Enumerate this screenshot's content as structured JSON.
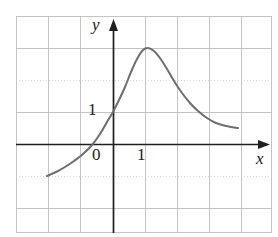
{
  "figure": {
    "name": "graph-on-grid-paper",
    "background_color": "#ffffff",
    "grid": {
      "visible": true,
      "line_color": "#b9b9b9",
      "dotted_line_color": "#c9c9c9",
      "cell_size_px": 32,
      "left_px": 16,
      "top_px": 16,
      "right_px": 272,
      "bottom_px": 233,
      "columns": 8,
      "rows": 7
    },
    "axes": {
      "color": "#1f1f1f",
      "origin_px": {
        "x": 113,
        "y": 144
      },
      "x_axis": {
        "label": "x",
        "arrow": true,
        "start_px": 16,
        "end_px": 270,
        "y_px": 144
      },
      "y_axis": {
        "label": "y",
        "arrow": true,
        "start_px": 233,
        "end_px": 19,
        "x_px": 113
      }
    },
    "tick_labels": {
      "y_one": "1",
      "x_zero": "0",
      "x_one": "1"
    }
  },
  "chart_data": {
    "type": "line",
    "title": "",
    "xlabel": "x",
    "ylabel": "y",
    "grid": true,
    "legend": null,
    "xlim": [
      -3.03,
      4.97
    ],
    "ylim": [
      -3.5,
      4.0
    ],
    "x_unit_px": 32,
    "y_unit_px": 32,
    "x_tick_labels": [
      {
        "value": 0,
        "label": "0"
      },
      {
        "value": 1,
        "label": "1"
      }
    ],
    "y_tick_labels": [
      {
        "value": 1,
        "label": "1"
      }
    ],
    "series": [
      {
        "name": "curve",
        "color": "#6e6e6e",
        "line_width_px": 2,
        "annotations": {
          "peak": {
            "x": 1.0,
            "y": 3.0
          },
          "left_endpoint": {
            "x": -2.06,
            "y": -1.0
          },
          "right_endpoint": {
            "x": 3.91,
            "y": 0.5
          },
          "y_intercept": {
            "x": 0.0,
            "y": 1.0
          }
        },
        "points_px": [
          [
            47,
            176
          ],
          [
            56,
            172
          ],
          [
            65,
            167
          ],
          [
            74,
            161
          ],
          [
            83,
            154
          ],
          [
            92,
            145
          ],
          [
            100,
            134
          ],
          [
            107,
            122
          ],
          [
            113,
            112
          ],
          [
            119,
            100
          ],
          [
            125,
            87
          ],
          [
            131,
            72
          ],
          [
            137,
            59
          ],
          [
            143,
            50
          ],
          [
            148,
            48
          ],
          [
            154,
            51
          ],
          [
            160,
            58
          ],
          [
            167,
            69
          ],
          [
            174,
            81
          ],
          [
            182,
            93
          ],
          [
            190,
            103
          ],
          [
            198,
            111
          ],
          [
            207,
            118
          ],
          [
            216,
            123
          ],
          [
            226,
            126
          ],
          [
            238,
            128
          ]
        ],
        "points_data": [
          [
            -2.06,
            -1.0
          ],
          [
            -1.78,
            -0.88
          ],
          [
            -1.5,
            -0.72
          ],
          [
            -1.22,
            -0.53
          ],
          [
            -0.94,
            -0.31
          ],
          [
            -0.66,
            -0.03
          ],
          [
            -0.41,
            0.31
          ],
          [
            -0.19,
            0.69
          ],
          [
            0.0,
            1.0
          ],
          [
            0.19,
            1.38
          ],
          [
            0.38,
            1.78
          ],
          [
            0.56,
            2.25
          ],
          [
            0.75,
            2.66
          ],
          [
            0.94,
            2.94
          ],
          [
            1.09,
            3.0
          ],
          [
            1.28,
            2.91
          ],
          [
            1.47,
            2.69
          ],
          [
            1.69,
            2.34
          ],
          [
            1.91,
            1.97
          ],
          [
            2.16,
            1.59
          ],
          [
            2.41,
            1.28
          ],
          [
            2.66,
            1.03
          ],
          [
            2.94,
            0.81
          ],
          [
            3.22,
            0.66
          ],
          [
            3.53,
            0.56
          ],
          [
            3.91,
            0.5
          ]
        ]
      }
    ]
  }
}
